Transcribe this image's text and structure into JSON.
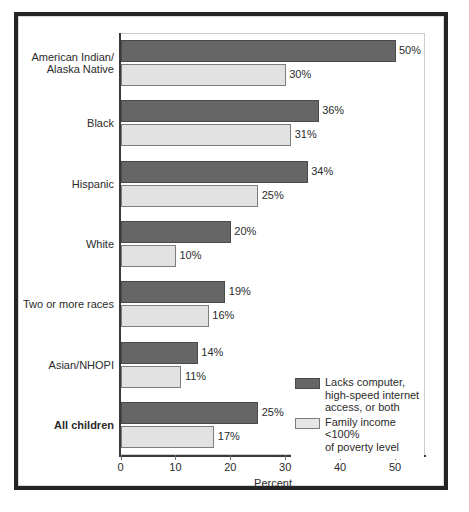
{
  "chart_data": {
    "type": "bar",
    "orientation": "horizontal",
    "title": "",
    "xlabel": "Percent",
    "ylabel": "",
    "xlim": [
      0,
      55
    ],
    "xticks": [
      0,
      10,
      20,
      30,
      40,
      50
    ],
    "xtick_labels": [
      "0",
      "10",
      "20",
      "30",
      "40",
      "50"
    ],
    "grid": false,
    "legend_position": "inside-lower-right",
    "categories": [
      "American Indian/\nAlaska Native",
      "Black",
      "Hispanic",
      "White",
      "Two or more races",
      "Asian/NHOPI",
      "All children"
    ],
    "category_emphasis": [
      false,
      false,
      false,
      false,
      false,
      false,
      true
    ],
    "series": [
      {
        "name": "Lacks computer,\nhigh-speed internet\naccess, or both",
        "color": "#666666",
        "values": [
          50,
          36,
          34,
          20,
          19,
          14,
          25
        ],
        "value_labels": [
          "50%",
          "36%",
          "34%",
          "20%",
          "19%",
          "14%",
          "25%"
        ]
      },
      {
        "name": "Family income <100%\nof poverty level",
        "color": "#e2e2e2",
        "values": [
          30,
          31,
          25,
          10,
          16,
          11,
          17
        ],
        "value_labels": [
          "30%",
          "31%",
          "25%",
          "10%",
          "16%",
          "11%",
          "17%"
        ]
      }
    ]
  },
  "colors": {
    "frame": "#242424",
    "axis": "#3a3a3a",
    "panel_border": "#cccccc",
    "text": "#2b2b2b",
    "series_dark": "#666666",
    "series_light": "#e2e2e2",
    "background": "#ffffff"
  }
}
